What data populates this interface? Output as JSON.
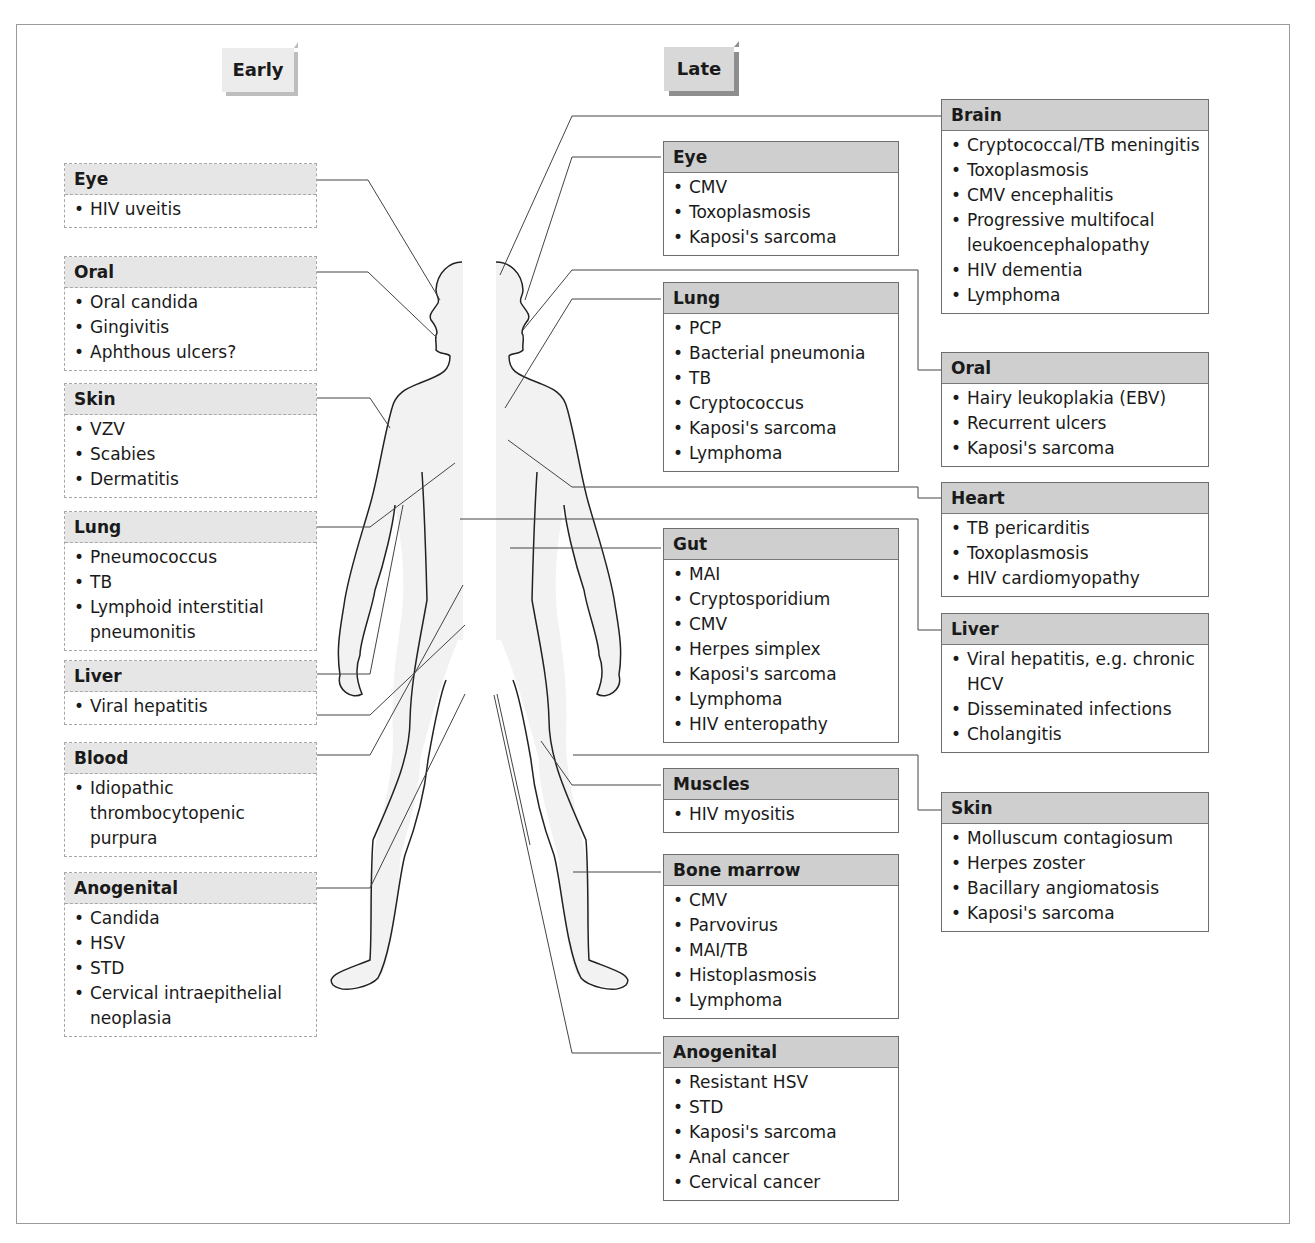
{
  "headers": {
    "early": "Early",
    "late": "Late"
  },
  "early": [
    {
      "id": "eye",
      "title": "Eye",
      "items": [
        "HIV uveitis"
      ]
    },
    {
      "id": "oral",
      "title": "Oral",
      "items": [
        "Oral candida",
        "Gingivitis",
        "Aphthous ulcers?"
      ]
    },
    {
      "id": "skin",
      "title": "Skin",
      "items": [
        "VZV",
        "Scabies",
        "Dermatitis"
      ]
    },
    {
      "id": "lung",
      "title": "Lung",
      "items": [
        "Pneumococcus",
        "TB",
        "Lymphoid interstitial pneumonitis"
      ]
    },
    {
      "id": "liver",
      "title": "Liver",
      "items": [
        "Viral hepatitis"
      ]
    },
    {
      "id": "blood",
      "title": "Blood",
      "items": [
        "Idiopathic thrombocytopenic purpura"
      ]
    },
    {
      "id": "anogenital",
      "title": "Anogenital",
      "items": [
        "Candida",
        "HSV",
        "STD",
        "Cervical intraepithelial neoplasia"
      ]
    }
  ],
  "late_middle": [
    {
      "id": "eye",
      "title": "Eye",
      "items": [
        "CMV",
        "Toxoplasmosis",
        "Kaposi's sarcoma"
      ]
    },
    {
      "id": "lung",
      "title": "Lung",
      "items": [
        "PCP",
        "Bacterial pneumonia",
        "TB",
        "Cryptococcus",
        "Kaposi's sarcoma",
        "Lymphoma"
      ]
    },
    {
      "id": "gut",
      "title": "Gut",
      "items": [
        "MAI",
        "Cryptosporidium",
        "CMV",
        "Herpes simplex",
        "Kaposi's sarcoma",
        "Lymphoma",
        "HIV enteropathy"
      ]
    },
    {
      "id": "muscles",
      "title": "Muscles",
      "items": [
        "HIV myositis"
      ]
    },
    {
      "id": "bone-marrow",
      "title": "Bone marrow",
      "items": [
        "CMV",
        "Parvovirus",
        "MAI/TB",
        "Histoplasmosis",
        "Lymphoma"
      ]
    },
    {
      "id": "anogenital",
      "title": "Anogenital",
      "items": [
        "Resistant HSV",
        "STD",
        "Kaposi's sarcoma",
        "Anal cancer",
        "Cervical cancer"
      ]
    }
  ],
  "late_right": [
    {
      "id": "brain",
      "title": "Brain",
      "items": [
        "Cryptococcal/TB meningitis",
        "Toxoplasmosis",
        "CMV encephalitis",
        "Progressive multifocal leukoencephalopathy",
        "HIV dementia",
        "Lymphoma"
      ]
    },
    {
      "id": "oral",
      "title": "Oral",
      "items": [
        "Hairy leukoplakia (EBV)",
        "Recurrent ulcers",
        "Kaposi's sarcoma"
      ]
    },
    {
      "id": "heart",
      "title": "Heart",
      "items": [
        "TB pericarditis",
        "Toxoplasmosis",
        "HIV cardiomyopathy"
      ]
    },
    {
      "id": "liver",
      "title": "Liver",
      "items": [
        "Viral hepatitis, e.g. chronic HCV",
        "Disseminated infections",
        "Cholangitis"
      ]
    },
    {
      "id": "skin",
      "title": "Skin",
      "items": [
        "Molluscum contagiosum",
        "Herpes zoster",
        "Bacillary angiomatosis",
        "Kaposi's sarcoma"
      ]
    }
  ],
  "colors": {
    "early_header": "#e6e6e6",
    "late_header": "#cfcfcf",
    "body_fill": "#f2f2f2",
    "outline": "#222222"
  }
}
